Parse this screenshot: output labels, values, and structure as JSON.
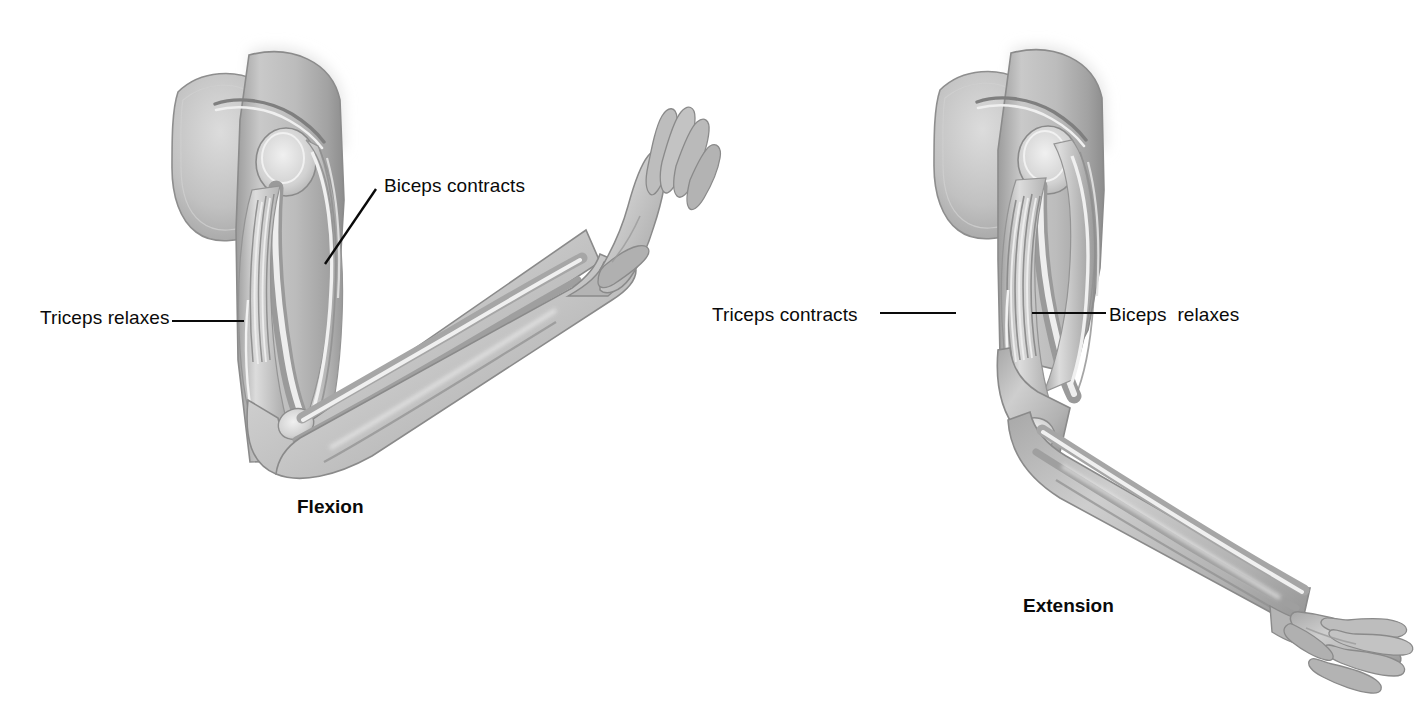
{
  "figure": {
    "background_color": "#ffffff",
    "ink_color": "#0a0a0a",
    "panels": [
      {
        "id": "flexion",
        "caption": "Flexion",
        "description": "Arm bent at the elbow with forearm raised and palm open facing upward",
        "labels": [
          {
            "id": "biceps-contracts",
            "text": "Biceps contracts",
            "leader": "diagonal"
          },
          {
            "id": "triceps-relaxes",
            "text": "Triceps relaxes",
            "leader": "horizontal"
          }
        ]
      },
      {
        "id": "extension",
        "caption": "Extension",
        "description": "Arm extended downward at the elbow with forearm lowered and palm open facing upward",
        "labels": [
          {
            "id": "triceps-contracts",
            "text": "Triceps contracts",
            "leader": "horizontal"
          },
          {
            "id": "biceps-relaxes",
            "text": "Biceps  relaxes",
            "leader": "horizontal"
          }
        ]
      }
    ],
    "palette": {
      "skin_light": "#d9d9d9",
      "skin_mid": "#b8b8b8",
      "skin_dark": "#8f8f8f",
      "muscle_light": "#e6e6e6",
      "muscle_mid": "#bdbdbd",
      "bone_highlight": "#f2f2f2",
      "outline": "#6e6e6e"
    }
  }
}
